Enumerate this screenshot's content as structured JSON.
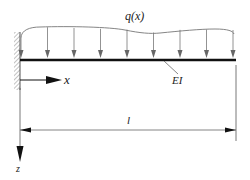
{
  "diagram": {
    "type": "cantilever-beam",
    "load_label": "q(x)",
    "beam_label": "EI",
    "x_axis_label": "x",
    "z_axis_label": "z",
    "length_label": "l",
    "support": "fixed-wall-left",
    "load_arrow_count": 9,
    "colors": {
      "beam": "#111111",
      "load": "#777777",
      "dimension": "#555555",
      "axis": "#111111",
      "hatch": "#888888"
    }
  }
}
